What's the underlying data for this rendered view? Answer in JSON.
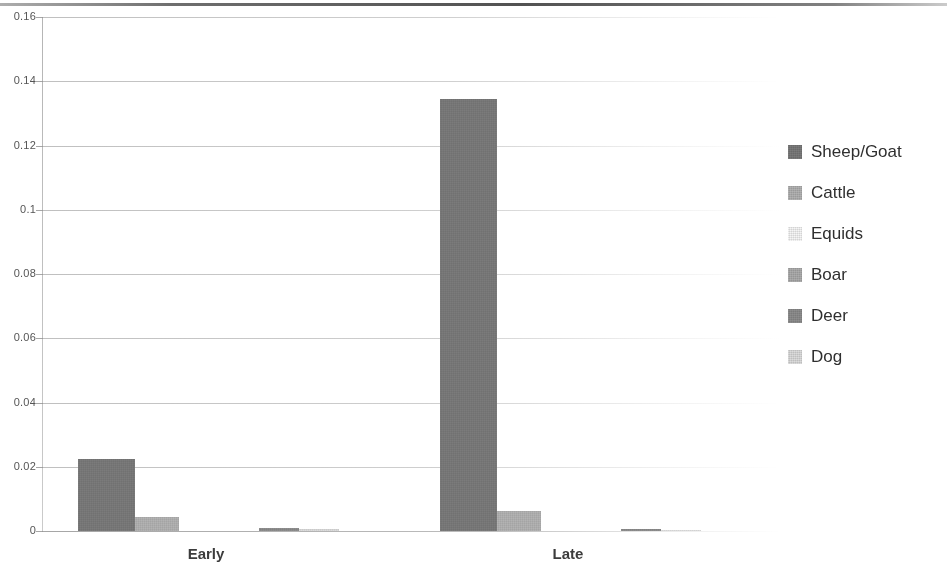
{
  "chart_data": {
    "type": "bar",
    "title": "",
    "subtitle": "",
    "xlabel": "",
    "ylabel": "",
    "categories": [
      "Early",
      "Late"
    ],
    "ylim": [
      0,
      0.16
    ],
    "ytick_labels": [
      "0.16",
      "0.14",
      "0.12",
      "0.1",
      "0.08",
      "0.06",
      "0.04",
      "0.02",
      "0"
    ],
    "ytick_values": [
      0.16,
      0.14,
      0.12,
      0.1,
      0.08,
      0.06,
      0.04,
      0.02,
      0
    ],
    "grid": true,
    "legend_position": "right",
    "series": [
      {
        "name": "Sheep/Goat",
        "color": "#7b7b7b",
        "values": [
          0.0223,
          0.1345
        ]
      },
      {
        "name": "Cattle",
        "color": "#b3b3b3",
        "values": [
          0.0045,
          0.0063
        ]
      },
      {
        "name": "Equids",
        "color": "#f2f2f2",
        "values": [
          0.0,
          0.0
        ]
      },
      {
        "name": "Boar",
        "color": "#adadad",
        "values": [
          0.0,
          0.0
        ]
      },
      {
        "name": "Deer",
        "color": "#8e8e8e",
        "values": [
          0.0008,
          0.0006
        ]
      },
      {
        "name": "Dog",
        "color": "#dcdcdc",
        "values": [
          0.0005,
          0.0004
        ]
      }
    ]
  },
  "legend": {
    "items": [
      {
        "label": "Sheep/Goat",
        "color": "#7b7b7b"
      },
      {
        "label": "Cattle",
        "color": "#b3b3b3"
      },
      {
        "label": "Equids",
        "color": "#f6f6f6"
      },
      {
        "label": "Boar",
        "color": "#adadad"
      },
      {
        "label": "Deer",
        "color": "#8e8e8e"
      },
      {
        "label": "Dog",
        "color": "#dcdcdc"
      }
    ]
  },
  "axis": {
    "y_labels": [
      "0.16",
      "0.14",
      "0.12",
      "0.1",
      "0.08",
      "0.06",
      "0.04",
      "0.02",
      "0"
    ],
    "x_labels": [
      "Early",
      "Late"
    ]
  }
}
